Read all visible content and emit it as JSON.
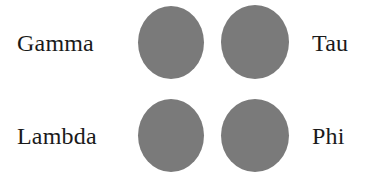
{
  "figure": {
    "type": "labeled-shape-grid",
    "background_color": "#ffffff",
    "shape_color": "#7a7a7a",
    "label_color": "#1a1a1a",
    "rows": [
      {
        "left_label": "Gamma",
        "right_label": "Tau",
        "shapes": [
          "circle",
          "circle"
        ]
      },
      {
        "left_label": "Lambda",
        "right_label": "Phi",
        "shapes": [
          "circle",
          "circle"
        ]
      }
    ],
    "labels": {
      "gamma": "Gamma",
      "tau": "Tau",
      "lambda": "Lambda",
      "phi": "Phi"
    }
  }
}
